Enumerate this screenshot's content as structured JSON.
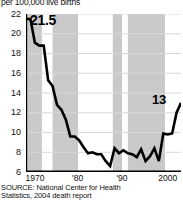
{
  "header": {
    "unit_label": "per 100,000 live births"
  },
  "source": {
    "line1": "SOURCE: National Center for Health",
    "line2": "Statistics, 2004 death report"
  },
  "callouts": {
    "start": "21.5",
    "end": "13"
  },
  "colors": {
    "line": "#000000",
    "gridline": "#d8d8d8",
    "band_shaded": "#c9c9c9",
    "band_plain": "#ffffff",
    "axis": "#000000",
    "text": "#111111"
  },
  "chart_data": {
    "type": "line",
    "title": "",
    "subtitle": "",
    "xlabel": "",
    "ylabel": "per 100,000 live births",
    "ylim": [
      6,
      22
    ],
    "yticks": [
      22,
      20,
      18,
      16,
      14,
      12,
      10,
      8,
      6
    ],
    "ytick_labels": [
      "22",
      "20",
      "18",
      "16",
      "14",
      "12",
      "10",
      "8",
      "6"
    ],
    "xlim": [
      1968,
      2003
    ],
    "xticks": [
      1970,
      1980,
      1990,
      2000
    ],
    "xtick_labels": [
      "1970",
      "'80",
      "'90",
      "2000"
    ],
    "grid": "horizontal",
    "legend": "none",
    "annotations": [
      {
        "label": "21.5",
        "x": 1968,
        "y": 21.5
      },
      {
        "label": "13",
        "x": 2003,
        "y": 13.0
      }
    ],
    "shaded_bands": [
      {
        "x0": 1968,
        "x1": 1971.6,
        "shade": "gray"
      },
      {
        "x0": 1971.6,
        "x1": 1974.0,
        "shade": "white"
      },
      {
        "x0": 1974.0,
        "x1": 1979.8,
        "shade": "gray"
      },
      {
        "x0": 1979.8,
        "x1": 1987.6,
        "shade": "white"
      },
      {
        "x0": 1987.6,
        "x1": 1989.7,
        "shade": "gray"
      },
      {
        "x0": 1989.7,
        "x1": 1991.0,
        "shade": "white"
      },
      {
        "x0": 1991.0,
        "x1": 1999.4,
        "shade": "gray"
      },
      {
        "x0": 1999.4,
        "x1": 2003,
        "shade": "white"
      }
    ],
    "x": [
      1968,
      1969,
      1970,
      1971,
      1972,
      1973,
      1974,
      1975,
      1976,
      1977,
      1978,
      1979,
      1980,
      1981,
      1982,
      1983,
      1984,
      1985,
      1986,
      1987,
      1988,
      1989,
      1990,
      1991,
      1992,
      1993,
      1994,
      1995,
      1996,
      1997,
      1998,
      1999,
      2000,
      2001,
      2002,
      2003
    ],
    "values": [
      21.5,
      21.5,
      19.1,
      18.8,
      18.8,
      15.3,
      14.7,
      12.8,
      12.3,
      11.3,
      9.6,
      9.6,
      9.2,
      8.5,
      7.9,
      8.0,
      7.8,
      7.8,
      7.1,
      6.6,
      8.4,
      7.9,
      8.2,
      7.9,
      7.8,
      7.5,
      8.3,
      7.1,
      7.6,
      8.4,
      7.1,
      9.9,
      9.8,
      9.9,
      12.0,
      13.0
    ]
  }
}
